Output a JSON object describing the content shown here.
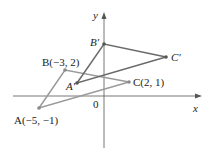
{
  "diagram": {
    "type": "coordinate-plane-translation",
    "axes": {
      "x_label": "x",
      "y_label": "y",
      "origin_label": "0",
      "color": "#555555"
    },
    "original_triangle": {
      "color": "#9a9a9a",
      "vertices": [
        {
          "name": "A",
          "coords": [
            -5,
            -1
          ],
          "label": "A(−5, −1)"
        },
        {
          "name": "B",
          "coords": [
            -3,
            2
          ],
          "label": "B(−3, 2)"
        },
        {
          "name": "C",
          "coords": [
            2,
            1
          ],
          "label": "C(2, 1)"
        }
      ]
    },
    "image_triangle": {
      "color": "#6a6a6a",
      "vertices": [
        {
          "name": "A'",
          "label": "A′"
        },
        {
          "name": "B'",
          "label": "B′"
        },
        {
          "name": "C'",
          "label": "C′"
        }
      ]
    }
  }
}
